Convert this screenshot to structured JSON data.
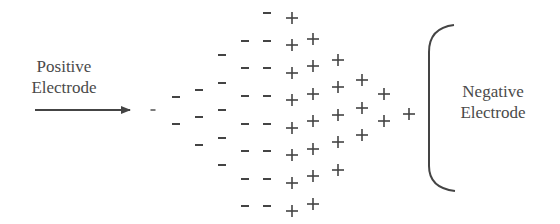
{
  "diagram": {
    "positive_electrode": {
      "line1": "Positive",
      "line2": "Electrode"
    },
    "negative_electrode": {
      "line1": "Negative",
      "line2": "Electrode"
    },
    "colors": {
      "ink": "#444444",
      "text": "#4a4a4a",
      "background": "#ffffff"
    },
    "arrow": {
      "x1": 35,
      "x2": 130,
      "y": 110
    },
    "bracket": {
      "x": 429,
      "top": 25,
      "bottom": 191,
      "tip_x": 454
    },
    "negative_charges": [
      {
        "col": 1,
        "x": 153,
        "ys": [
          110
        ],
        "small": true
      },
      {
        "col": 2,
        "x": 176,
        "ys": [
          97,
          124
        ]
      },
      {
        "col": 3,
        "x": 199,
        "ys": [
          90,
          117,
          145
        ]
      },
      {
        "col": 4,
        "x": 222,
        "ys": [
          55,
          83,
          110,
          138,
          165
        ]
      },
      {
        "col": 5,
        "x": 245,
        "ys": [
          41,
          68,
          96,
          124,
          151,
          179,
          206
        ]
      },
      {
        "col": 6,
        "x": 267,
        "ys": [
          13,
          41,
          68,
          96,
          124,
          151,
          179,
          206
        ]
      }
    ],
    "positive_charges": [
      {
        "col": 1,
        "x": 292,
        "ys": [
          18,
          45,
          73,
          100,
          128,
          155,
          183,
          211
        ]
      },
      {
        "col": 2,
        "x": 313,
        "ys": [
          39,
          66,
          94,
          121,
          149,
          176,
          204
        ]
      },
      {
        "col": 3,
        "x": 338,
        "ys": [
          60,
          87,
          115,
          142,
          170
        ]
      },
      {
        "col": 4,
        "x": 362,
        "ys": [
          80,
          108,
          135
        ]
      },
      {
        "col": 5,
        "x": 384,
        "ys": [
          94,
          121
        ]
      },
      {
        "col": 6,
        "x": 409,
        "ys": [
          114
        ]
      }
    ]
  }
}
